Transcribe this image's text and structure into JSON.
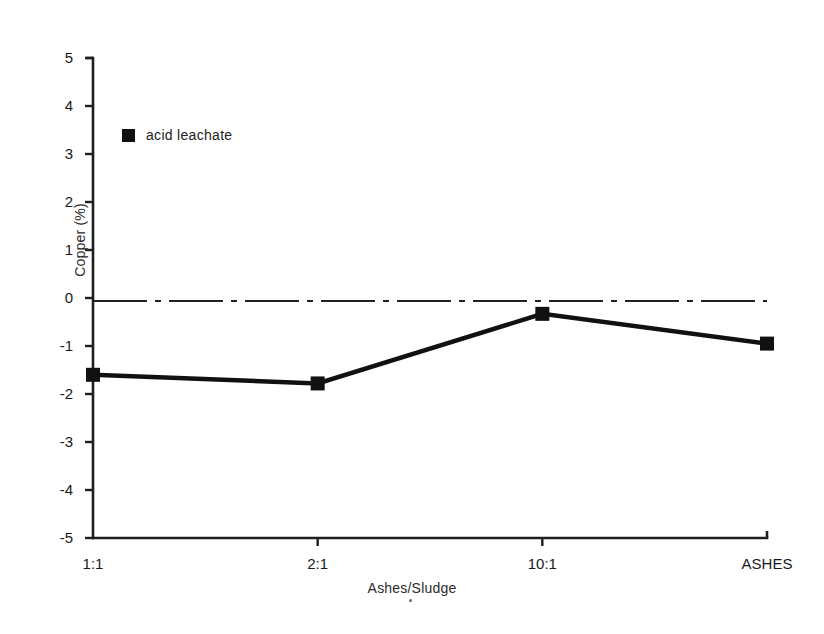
{
  "chart_data": {
    "type": "line",
    "title": "",
    "subtitle": "",
    "xlabel": "Ashes/Sludge",
    "ylabel": "Copper (%)",
    "categories": [
      "1:1",
      "2:1",
      "10:1",
      "ASHES"
    ],
    "series": [
      {
        "name": "acid leachate",
        "values": [
          -1.6,
          -1.78,
          -0.33,
          -0.95
        ],
        "marker": "filled-square",
        "color": "#111111"
      }
    ],
    "ylim": [
      -5,
      5
    ],
    "yticks": [
      5,
      4,
      3,
      2,
      1,
      0,
      -1,
      -2,
      -3,
      -4,
      -5
    ],
    "ytick_labels": [
      "5",
      "4",
      "3",
      "2",
      "1",
      "0",
      "-1",
      "-2",
      "-3",
      "-4",
      "-5"
    ],
    "xtick_labels": [
      "1:1",
      "2:1",
      "10:1",
      "ASHES"
    ],
    "grid": false,
    "zero_line": {
      "value": 0,
      "style": "dash-dot",
      "color": "#1f1f1f"
    },
    "legend": {
      "position": "top-left",
      "entries": [
        {
          "label": "acid leachate",
          "marker": "filled-square",
          "color": "#111111"
        }
      ]
    },
    "axis_color": "#1f1f1f",
    "line_color": "#111111"
  }
}
